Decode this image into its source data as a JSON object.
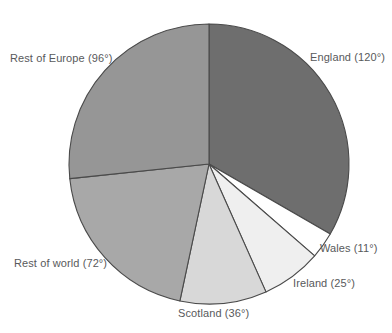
{
  "chart_data": {
    "type": "pie",
    "title": "",
    "subtitle": "",
    "xlabel": "",
    "ylabel": "",
    "legend_position": "none",
    "grid": false,
    "units": "degrees",
    "total_degrees": 360,
    "start_angle_deg": 0,
    "direction": "clockwise",
    "categories": [
      "England",
      "Wales",
      "Ireland",
      "Scotland",
      "Rest of world",
      "Rest of Europe"
    ],
    "values": [
      120,
      11,
      25,
      36,
      72,
      96
    ],
    "labels": [
      "England (120°)",
      "Wales (11°)",
      "Ireland (25°)",
      "Scotland (36°)",
      "Rest of world (72°)",
      "Rest of Europe (96°)"
    ],
    "colors": [
      "#6e6e6e",
      "#ffffff",
      "#efefef",
      "#d8d8d8",
      "#a8a8a8",
      "#969696"
    ],
    "slices": [
      {
        "name": "England",
        "value": 120,
        "label": "England (120°)",
        "color": "#6e6e6e",
        "start_deg": 0,
        "end_deg": 120
      },
      {
        "name": "Wales",
        "value": 11,
        "label": "Wales (11°)",
        "color": "#ffffff",
        "start_deg": 120,
        "end_deg": 131
      },
      {
        "name": "Ireland",
        "value": 25,
        "label": "Ireland (25°)",
        "color": "#efefef",
        "start_deg": 131,
        "end_deg": 156
      },
      {
        "name": "Scotland",
        "value": 36,
        "label": "Scotland (36°)",
        "color": "#d8d8d8",
        "start_deg": 156,
        "end_deg": 192
      },
      {
        "name": "Rest of world",
        "value": 72,
        "label": "Rest of world (72°)",
        "color": "#a8a8a8",
        "start_deg": 192,
        "end_deg": 264
      },
      {
        "name": "Rest of Europe",
        "value": 96,
        "label": "Rest of Europe (96°)",
        "color": "#969696",
        "start_deg": 264,
        "end_deg": 360
      }
    ],
    "stroke_color": "#4a4a4a",
    "label_color": "#58595b",
    "background": "#ffffff"
  },
  "geometry": {
    "center_x": 209,
    "center_y": 164,
    "radius": 140
  }
}
